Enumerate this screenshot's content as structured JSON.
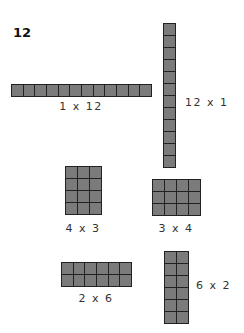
{
  "title": "12",
  "colors": {
    "cell_fill": "#7b7b7b",
    "cell_border": "#222222",
    "label": "#333333",
    "background": "#ffffff"
  },
  "arrays": [
    {
      "id": "1x12",
      "label": "1 x 12",
      "rows": 1,
      "cols": 12,
      "x": 11,
      "y": 84,
      "w": 141,
      "h": 13,
      "label_x": 81,
      "label_y": 100,
      "label_align": "center"
    },
    {
      "id": "12x1",
      "label": "12 x 1",
      "rows": 12,
      "cols": 1,
      "x": 163,
      "y": 23,
      "w": 13,
      "h": 145,
      "label_x": 185,
      "label_y": 96,
      "label_align": "left"
    },
    {
      "id": "4x3",
      "label": "4 x 3",
      "rows": 4,
      "cols": 3,
      "x": 65,
      "y": 166,
      "w": 37,
      "h": 49,
      "label_x": 83,
      "label_y": 222,
      "label_align": "center"
    },
    {
      "id": "3x4",
      "label": "3 x 4",
      "rows": 3,
      "cols": 4,
      "x": 152,
      "y": 179,
      "w": 49,
      "h": 37,
      "label_x": 176,
      "label_y": 222,
      "label_align": "center"
    },
    {
      "id": "2x6",
      "label": "2 x 6",
      "rows": 2,
      "cols": 6,
      "x": 61,
      "y": 262,
      "w": 71,
      "h": 25,
      "label_x": 96,
      "label_y": 292,
      "label_align": "center"
    },
    {
      "id": "6x2",
      "label": "6 x 2",
      "rows": 6,
      "cols": 2,
      "x": 164,
      "y": 251,
      "w": 25,
      "h": 73,
      "label_x": 196,
      "label_y": 279,
      "label_align": "left"
    }
  ]
}
